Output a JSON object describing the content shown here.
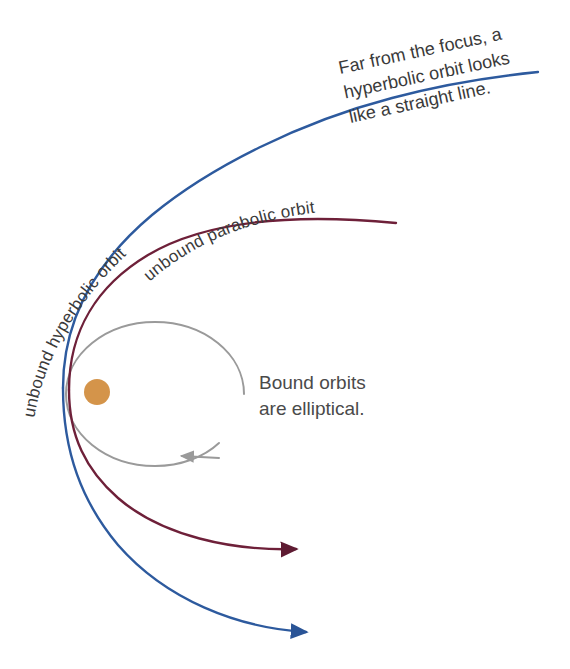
{
  "diagram": {
    "background": "#ffffff",
    "central_body": {
      "name": "focus-body",
      "color": "#d4944a",
      "cx": 97,
      "cy": 392,
      "r": 13
    },
    "colors": {
      "hyperbolic": "#2d5a9e",
      "parabolic": "#6e2039",
      "elliptical": "#9a9a9a",
      "text": "#3a3a3a"
    },
    "labels": {
      "hyperbolic": "unbound hyperbolic orbit",
      "parabolic": "unbound parabolic orbit",
      "bound_line1": "Bound orbits",
      "bound_line2": "are elliptical.",
      "straight_line_note_1": "Far from the focus, a",
      "straight_line_note_2": "hyperbolic orbit looks",
      "straight_line_note_3": "like a straight line."
    }
  }
}
